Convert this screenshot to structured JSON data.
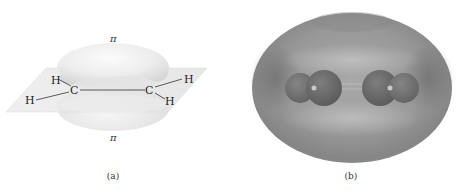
{
  "figure": {
    "panel_a": {
      "caption": "(a)",
      "pi_top_label": "π",
      "pi_bottom_label": "π",
      "atoms": {
        "c_left": "C",
        "c_right": "C",
        "h_upper_left": "H",
        "h_lower_left": "H",
        "h_upper_right": "H",
        "h_lower_right": "H"
      },
      "colors": {
        "plane": "#e6e6e6",
        "lobe": "#f0f0f0",
        "bond": "#333333"
      }
    },
    "panel_b": {
      "caption": "(b)",
      "colors": {
        "surface": "#9a9a9a",
        "surface_dark": "#6e6e6e",
        "atom_carbon": "#6a6a6a",
        "atom_hydrogen": "#7a7a7a"
      }
    }
  }
}
